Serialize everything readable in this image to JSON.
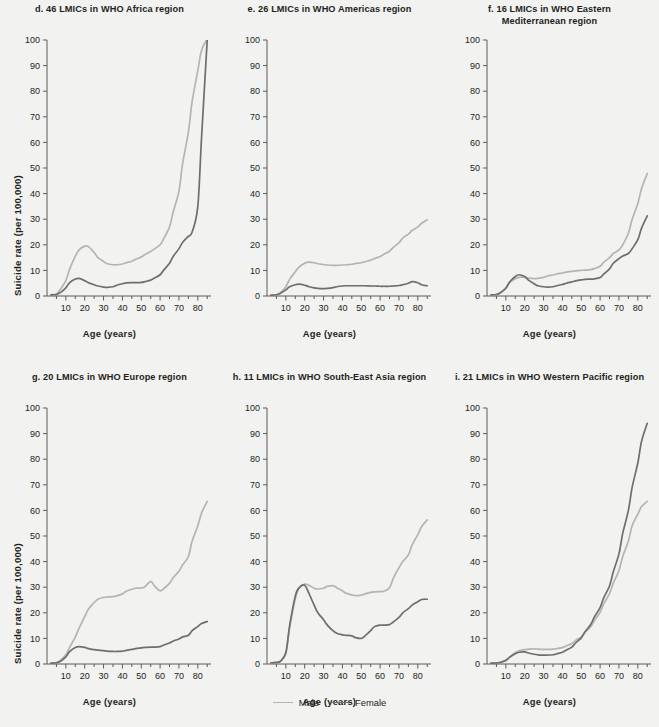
{
  "figure": {
    "background": "#f2f2f0",
    "axis_label_x": "Age (years)",
    "axis_label_y": "Suicide rate (per 100,000)"
  },
  "legend": {
    "position": "bottom-center",
    "items": [
      {
        "label": "Male",
        "color": "#b4b4b4"
      },
      {
        "label": "Female",
        "color": "#6e6e6e"
      }
    ]
  },
  "chart_data": [
    {
      "type": "line",
      "id": "d",
      "title": "d. 46 LMICs in WHO Africa region",
      "xlabel": "Age (years)",
      "ylabel": "Suicide rate (per 100,000)",
      "xlim": [
        0,
        87
      ],
      "ylim": [
        0,
        100
      ],
      "xticks": [
        10,
        20,
        30,
        40,
        50,
        60,
        70,
        80
      ],
      "yticks": [
        0,
        10,
        20,
        30,
        40,
        50,
        60,
        70,
        80,
        90,
        100
      ],
      "grid": false,
      "x": [
        2,
        5,
        7,
        10,
        12,
        15,
        17,
        20,
        22,
        25,
        27,
        30,
        32,
        35,
        37,
        40,
        42,
        45,
        47,
        50,
        52,
        55,
        57,
        60,
        62,
        65,
        67,
        70,
        72,
        75,
        77,
        80,
        82,
        85
      ],
      "series": [
        {
          "name": "Male",
          "color": "#b4b4b4",
          "values": [
            0.5,
            0.8,
            2.5,
            6.0,
            10.5,
            15.5,
            18.0,
            19.5,
            19.3,
            17.0,
            15.0,
            13.5,
            12.6,
            12.2,
            12.2,
            12.5,
            13.0,
            13.6,
            14.3,
            15.2,
            16.2,
            17.4,
            18.4,
            20.0,
            22.5,
            27.0,
            33.0,
            41.0,
            52.0,
            64.0,
            76.0,
            88.0,
            96.0,
            100.5
          ]
        },
        {
          "name": "Female",
          "color": "#6e6e6e",
          "values": [
            0.4,
            0.6,
            1.3,
            3.2,
            5.2,
            6.6,
            6.9,
            6.0,
            5.2,
            4.4,
            3.9,
            3.5,
            3.4,
            3.6,
            4.2,
            4.8,
            5.1,
            5.2,
            5.2,
            5.3,
            5.6,
            6.2,
            7.0,
            8.3,
            10.2,
            12.8,
            15.5,
            18.5,
            21.0,
            23.3,
            25.0,
            35.0,
            62.0,
            100.0
          ]
        }
      ]
    },
    {
      "type": "line",
      "id": "e",
      "title": "e. 26 LMICs in WHO Americas region",
      "xlabel": "Age (years)",
      "ylabel": "",
      "xlim": [
        0,
        87
      ],
      "ylim": [
        0,
        100
      ],
      "xticks": [
        10,
        20,
        30,
        40,
        50,
        60,
        70,
        80
      ],
      "yticks": [
        0,
        10,
        20,
        30,
        40,
        50,
        60,
        70,
        80,
        90,
        100
      ],
      "grid": false,
      "x": [
        2,
        5,
        7,
        10,
        12,
        15,
        17,
        20,
        22,
        25,
        27,
        30,
        32,
        35,
        37,
        40,
        42,
        45,
        47,
        50,
        52,
        55,
        57,
        60,
        62,
        65,
        67,
        70,
        72,
        75,
        77,
        80,
        82,
        85
      ],
      "series": [
        {
          "name": "Male",
          "color": "#b4b4b4",
          "values": [
            0.3,
            0.5,
            1.2,
            3.6,
            6.5,
            9.5,
            11.3,
            12.8,
            13.2,
            13.0,
            12.6,
            12.3,
            12.1,
            12.0,
            12.0,
            12.1,
            12.2,
            12.4,
            12.7,
            13.0,
            13.4,
            14.0,
            14.6,
            15.4,
            16.3,
            17.5,
            19.0,
            20.8,
            22.6,
            24.2,
            25.6,
            27.0,
            28.4,
            29.8
          ]
        },
        {
          "name": "Female",
          "color": "#6e6e6e",
          "values": [
            0.3,
            0.5,
            1.0,
            2.4,
            3.6,
            4.4,
            4.6,
            4.2,
            3.7,
            3.2,
            3.0,
            2.9,
            3.0,
            3.3,
            3.6,
            3.9,
            4.0,
            4.0,
            4.0,
            4.0,
            4.0,
            3.9,
            3.9,
            3.8,
            3.8,
            3.8,
            3.9,
            4.1,
            4.4,
            5.0,
            5.6,
            5.2,
            4.4,
            4.0
          ]
        }
      ]
    },
    {
      "type": "line",
      "id": "f",
      "title": "f. 16 LMICs in WHO Eastern Mediterranean region",
      "title_lines": [
        "f. 16 LMICs in WHO Eastern",
        "Mediterranean region"
      ],
      "xlabel": "Age (years)",
      "ylabel": "",
      "xlim": [
        0,
        87
      ],
      "ylim": [
        0,
        100
      ],
      "xticks": [
        10,
        20,
        30,
        40,
        50,
        60,
        70,
        80
      ],
      "yticks": [
        0,
        10,
        20,
        30,
        40,
        50,
        60,
        70,
        80,
        90,
        100
      ],
      "grid": false,
      "x": [
        2,
        5,
        7,
        10,
        12,
        15,
        17,
        20,
        22,
        25,
        27,
        30,
        32,
        35,
        37,
        40,
        42,
        45,
        47,
        50,
        52,
        55,
        57,
        60,
        62,
        65,
        67,
        70,
        72,
        75,
        77,
        80,
        82,
        85
      ],
      "series": [
        {
          "name": "Male",
          "color": "#b4b4b4",
          "values": [
            0.4,
            0.6,
            1.3,
            3.2,
            5.2,
            6.7,
            7.3,
            7.3,
            7.0,
            6.8,
            6.9,
            7.3,
            7.8,
            8.2,
            8.6,
            9.0,
            9.3,
            9.6,
            9.8,
            10.0,
            10.1,
            10.3,
            10.7,
            11.6,
            13.2,
            15.0,
            16.6,
            18.0,
            20.0,
            24.5,
            30.0,
            36.0,
            42.0,
            47.8
          ]
        },
        {
          "name": "Female",
          "color": "#6e6e6e",
          "values": [
            0.4,
            0.6,
            1.2,
            3.0,
            5.5,
            7.6,
            8.3,
            7.6,
            6.2,
            4.8,
            4.0,
            3.6,
            3.5,
            3.6,
            4.0,
            4.5,
            5.0,
            5.5,
            5.9,
            6.3,
            6.5,
            6.6,
            6.7,
            7.2,
            8.6,
            10.6,
            12.8,
            14.6,
            15.6,
            16.6,
            18.5,
            22.0,
            26.5,
            31.3
          ]
        }
      ]
    },
    {
      "type": "line",
      "id": "g",
      "title": "g. 20 LMICs in WHO Europe region",
      "xlabel": "Age (years)",
      "ylabel": "Suicide rate (per 100,000)",
      "xlim": [
        0,
        87
      ],
      "ylim": [
        0,
        100
      ],
      "xticks": [
        10,
        20,
        30,
        40,
        50,
        60,
        70,
        80
      ],
      "yticks": [
        0,
        10,
        20,
        30,
        40,
        50,
        60,
        70,
        80,
        90,
        100
      ],
      "grid": false,
      "x": [
        2,
        5,
        7,
        10,
        12,
        15,
        17,
        20,
        22,
        25,
        27,
        30,
        32,
        35,
        37,
        40,
        42,
        45,
        47,
        50,
        52,
        55,
        57,
        60,
        62,
        65,
        67,
        70,
        72,
        75,
        77,
        80,
        82,
        85
      ],
      "series": [
        {
          "name": "Male",
          "color": "#b4b4b4",
          "values": [
            0.4,
            0.6,
            1.4,
            3.6,
            6.5,
            10.5,
            14.0,
            18.5,
            21.5,
            24.0,
            25.3,
            26.0,
            26.2,
            26.3,
            26.6,
            27.4,
            28.4,
            29.2,
            29.6,
            29.7,
            30.2,
            32.3,
            30.5,
            28.6,
            29.5,
            31.5,
            33.8,
            36.2,
            38.8,
            42.0,
            48.0,
            54.0,
            59.0,
            63.5
          ]
        },
        {
          "name": "Female",
          "color": "#6e6e6e",
          "values": [
            0.3,
            0.5,
            1.0,
            2.8,
            4.8,
            6.4,
            6.8,
            6.5,
            6.0,
            5.6,
            5.4,
            5.2,
            5.0,
            4.9,
            4.9,
            5.0,
            5.3,
            5.7,
            6.0,
            6.3,
            6.5,
            6.6,
            6.6,
            6.8,
            7.4,
            8.2,
            9.0,
            9.8,
            10.6,
            11.2,
            13.0,
            14.6,
            15.8,
            16.6
          ]
        }
      ]
    },
    {
      "type": "line",
      "id": "h",
      "title": "h. 11 LMICs in WHO South-East Asia region",
      "xlabel": "Age (years)",
      "ylabel": "",
      "xlim": [
        0,
        87
      ],
      "ylim": [
        0,
        100
      ],
      "xticks": [
        10,
        20,
        30,
        40,
        50,
        60,
        70,
        80
      ],
      "yticks": [
        0,
        10,
        20,
        30,
        40,
        50,
        60,
        70,
        80,
        90,
        100
      ],
      "grid": false,
      "x": [
        2,
        5,
        7,
        10,
        12,
        15,
        17,
        20,
        22,
        25,
        27,
        30,
        32,
        35,
        37,
        40,
        42,
        45,
        47,
        50,
        52,
        55,
        57,
        60,
        62,
        65,
        67,
        70,
        72,
        75,
        77,
        80,
        82,
        85
      ],
      "series": [
        {
          "name": "Male",
          "color": "#b4b4b4",
          "values": [
            0.4,
            0.6,
            1.0,
            4.0,
            14.0,
            25.5,
            29.5,
            31.2,
            30.8,
            29.6,
            29.3,
            29.6,
            30.3,
            30.6,
            29.8,
            28.6,
            27.6,
            27.0,
            26.7,
            26.9,
            27.4,
            28.0,
            28.2,
            28.3,
            28.4,
            29.8,
            33.5,
            37.6,
            40.0,
            42.6,
            46.5,
            50.5,
            53.6,
            56.3
          ]
        },
        {
          "name": "Female",
          "color": "#6e6e6e",
          "values": [
            0.4,
            0.6,
            1.0,
            4.5,
            15.0,
            26.5,
            29.8,
            30.8,
            28.0,
            23.0,
            20.0,
            17.3,
            15.2,
            13.0,
            12.0,
            11.4,
            11.2,
            11.0,
            10.3,
            10.0,
            11.0,
            13.0,
            14.6,
            15.2,
            15.2,
            15.4,
            16.4,
            18.2,
            20.0,
            21.6,
            23.0,
            24.3,
            25.2,
            25.3
          ]
        }
      ]
    },
    {
      "type": "line",
      "id": "i",
      "title": "i. 21 LMICs in WHO Western Pacific region",
      "xlabel": "Age (years)",
      "ylabel": "",
      "xlim": [
        0,
        87
      ],
      "ylim": [
        0,
        100
      ],
      "xticks": [
        10,
        20,
        30,
        40,
        50,
        60,
        70,
        80
      ],
      "yticks": [
        0,
        10,
        20,
        30,
        40,
        50,
        60,
        70,
        80,
        90,
        100
      ],
      "grid": false,
      "x": [
        2,
        5,
        7,
        10,
        12,
        15,
        17,
        20,
        22,
        25,
        27,
        30,
        32,
        35,
        37,
        40,
        42,
        45,
        47,
        50,
        52,
        55,
        57,
        60,
        62,
        65,
        67,
        70,
        72,
        75,
        77,
        80,
        82,
        85
      ],
      "series": [
        {
          "name": "Male",
          "color": "#b4b4b4",
          "values": [
            0.3,
            0.4,
            0.7,
            1.6,
            2.8,
            4.4,
            5.2,
            5.6,
            5.8,
            5.9,
            5.8,
            5.7,
            5.7,
            5.8,
            6.0,
            6.4,
            7.0,
            8.0,
            9.2,
            10.6,
            12.4,
            14.6,
            17.0,
            20.2,
            23.6,
            27.5,
            31.6,
            36.5,
            42.0,
            48.0,
            54.0,
            58.5,
            61.5,
            63.5
          ]
        },
        {
          "name": "Female",
          "color": "#6e6e6e",
          "values": [
            0.3,
            0.4,
            0.6,
            1.4,
            2.6,
            4.0,
            4.6,
            4.7,
            4.3,
            3.8,
            3.6,
            3.5,
            3.5,
            3.6,
            4.0,
            4.6,
            5.4,
            6.6,
            8.2,
            10.2,
            12.6,
            15.4,
            18.4,
            22.0,
            26.0,
            30.5,
            36.0,
            43.0,
            51.0,
            60.0,
            69.0,
            78.5,
            87.0,
            94.0
          ]
        }
      ]
    }
  ]
}
